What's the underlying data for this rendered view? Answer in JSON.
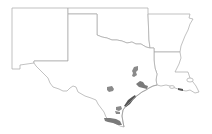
{
  "map": {
    "title": "",
    "area": "South-central United States",
    "states": [
      {
        "id": "new-mexico",
        "name": "New Mexico"
      },
      {
        "id": "oklahoma",
        "name": "Oklahoma"
      },
      {
        "id": "arkansas",
        "name": "Arkansas"
      },
      {
        "id": "texas",
        "name": "Texas"
      },
      {
        "id": "louisiana",
        "name": "Louisiana"
      }
    ],
    "highlighted_regions": [
      {
        "id": "north-central-texas",
        "state": "Texas"
      },
      {
        "id": "central-texas",
        "state": "Texas"
      },
      {
        "id": "houston-area",
        "state": "Texas"
      },
      {
        "id": "upper-coast",
        "state": "Texas"
      },
      {
        "id": "coastal-bend",
        "state": "Texas"
      },
      {
        "id": "lower-rio-grande-valley",
        "state": "Texas"
      },
      {
        "id": "sw-louisiana-coast",
        "state": "Louisiana"
      }
    ],
    "colors": {
      "background": "#ffffff",
      "border": "#a8a8a8",
      "highlight": "#8a8a8a",
      "highlight_dark": "#555555"
    }
  }
}
